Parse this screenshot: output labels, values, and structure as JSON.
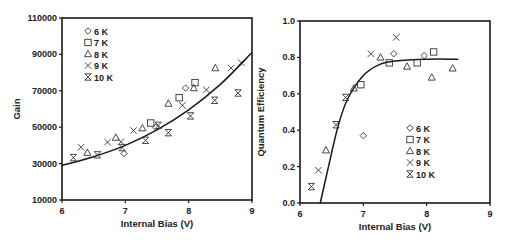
{
  "chart_data": [
    {
      "type": "scatter",
      "title": "",
      "xlabel": "Internal Bias (V)",
      "ylabel": "Gain",
      "xlim": [
        6,
        9
      ],
      "ylim": [
        10000,
        110000
      ],
      "xticks": [
        "6",
        "7",
        "8",
        "9"
      ],
      "yticks": [
        "10000",
        "30000",
        "50000",
        "70000",
        "90000",
        "110000"
      ],
      "grid": false,
      "legend_position": "upper left",
      "series": [
        {
          "name": "6 K",
          "marker": "diamond",
          "points": [
            [
              6.98,
              35500
            ],
            [
              7.48,
              50000
            ],
            [
              7.95,
              71500
            ]
          ]
        },
        {
          "name": "7 K",
          "marker": "square",
          "points": [
            [
              7.4,
              52300
            ],
            [
              7.85,
              66200
            ],
            [
              8.1,
              74500
            ]
          ]
        },
        {
          "name": "8 K",
          "marker": "triangle",
          "points": [
            [
              6.4,
              36000
            ],
            [
              6.85,
              44300
            ],
            [
              7.27,
              49500
            ],
            [
              7.68,
              63000
            ],
            [
              8.08,
              71500
            ],
            [
              8.42,
              82500
            ]
          ]
        },
        {
          "name": "9 K",
          "marker": "x",
          "points": [
            [
              6.3,
              39000
            ],
            [
              6.72,
              41800
            ],
            [
              6.93,
              42000
            ],
            [
              7.13,
              48200
            ],
            [
              7.9,
              62000
            ],
            [
              8.28,
              70500
            ],
            [
              8.67,
              82500
            ],
            [
              8.83,
              85500
            ]
          ]
        },
        {
          "name": "10 K",
          "marker": "asterisk-x",
          "points": [
            [
              6.18,
              33300
            ],
            [
              6.56,
              34800
            ],
            [
              6.95,
              38800
            ],
            [
              7.32,
              42800
            ],
            [
              7.52,
              51000
            ],
            [
              7.68,
              47000
            ],
            [
              8.03,
              56200
            ],
            [
              8.41,
              64800
            ],
            [
              8.78,
              68800
            ]
          ]
        }
      ],
      "fit_curve": {
        "type": "exponential",
        "points": [
          [
            6.0,
            29000
          ],
          [
            6.5,
            33800
          ],
          [
            7.0,
            40000
          ],
          [
            7.5,
            48500
          ],
          [
            8.0,
            59500
          ],
          [
            8.5,
            73500
          ],
          [
            9.0,
            91000
          ]
        ]
      }
    },
    {
      "type": "scatter",
      "title": "",
      "xlabel": "Internal Bias (V)",
      "ylabel": "Quantum Efficiency",
      "xlim": [
        6,
        9
      ],
      "ylim": [
        0.0,
        1.0
      ],
      "xticks": [
        "6",
        "7",
        "8",
        "9"
      ],
      "yticks": [
        "0.0",
        "0.2",
        "0.4",
        "0.6",
        "0.8",
        "1.0"
      ],
      "grid": false,
      "legend_position": "center right",
      "series": [
        {
          "name": "6 K",
          "marker": "diamond",
          "points": [
            [
              7.0,
              0.37
            ],
            [
              7.48,
              0.82
            ],
            [
              7.96,
              0.81
            ]
          ]
        },
        {
          "name": "7 K",
          "marker": "square",
          "points": [
            [
              6.96,
              0.65
            ],
            [
              7.41,
              0.77
            ],
            [
              7.85,
              0.77
            ],
            [
              8.11,
              0.83
            ]
          ]
        },
        {
          "name": "8 K",
          "marker": "triangle",
          "points": [
            [
              6.41,
              0.29
            ],
            [
              6.85,
              0.63
            ],
            [
              7.27,
              0.8
            ],
            [
              7.69,
              0.75
            ],
            [
              8.08,
              0.69
            ],
            [
              8.41,
              0.74
            ]
          ]
        },
        {
          "name": "9 K",
          "marker": "x",
          "points": [
            [
              6.29,
              0.18
            ],
            [
              7.12,
              0.82
            ],
            [
              7.52,
              0.91
            ]
          ]
        },
        {
          "name": "10 K",
          "marker": "asterisk-x",
          "points": [
            [
              6.18,
              0.09
            ],
            [
              6.57,
              0.43
            ],
            [
              6.72,
              0.58
            ]
          ]
        }
      ],
      "fit_curve": {
        "type": "saturating",
        "points": [
          [
            6.32,
            0.0
          ],
          [
            6.45,
            0.2
          ],
          [
            6.6,
            0.42
          ],
          [
            6.75,
            0.57
          ],
          [
            7.0,
            0.7
          ],
          [
            7.25,
            0.76
          ],
          [
            7.5,
            0.78
          ],
          [
            8.0,
            0.79
          ],
          [
            8.5,
            0.79
          ]
        ]
      }
    }
  ],
  "left_chart": {
    "ylabel": "Gain",
    "xlabel": "Internal Bias (V)",
    "legend": [
      "6 K",
      "7 K",
      "8 K",
      "9 K",
      "10 K"
    ]
  },
  "right_chart": {
    "ylabel": "Quantum Efficiency",
    "xlabel": "Internal Bias (V)",
    "legend": [
      "6 K",
      "7 K",
      "8 K",
      "9 K",
      "10 K"
    ]
  }
}
